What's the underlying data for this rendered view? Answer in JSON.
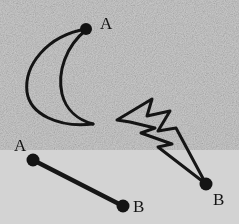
{
  "figure": {
    "background_color": "#d3d3d3",
    "ink_color": "#161616",
    "width": 239,
    "height": 224,
    "shapes": [
      {
        "name": "crescent-moon",
        "type": "crescent",
        "stroke_width": 3,
        "outer_arc": "M 86 29 C 46 36, 24 66, 27 92 C 30 114, 58 128, 93 124",
        "inner_arc": "M 86 30 C 66 46, 57 72, 62 94 C 66 110, 78 120, 93 124",
        "endpoints": [
          {
            "label": "A",
            "dot": true,
            "x": 86,
            "y": 29
          },
          {
            "label": "",
            "dot": false,
            "x": 93,
            "y": 124
          }
        ]
      },
      {
        "name": "lightning-bolt",
        "type": "polyline",
        "stroke_width": 3,
        "path": "M 117 120 L 152 99 L 147 116 L 170 111 L 158 131 L 176 128 L 206 184 L 158 147 L 172 144 L 141 133 L 155 128 L 130 122 Z",
        "endpoints": [
          {
            "label": "B",
            "dot": true,
            "x": 206,
            "y": 184
          }
        ]
      },
      {
        "name": "line-segment",
        "type": "line",
        "stroke_width": 4,
        "path": "M 33 160 L 123 206",
        "endpoints": [
          {
            "label": "A",
            "dot": true,
            "x": 33,
            "y": 160
          },
          {
            "label": "B",
            "dot": true,
            "x": 123,
            "y": 206
          }
        ]
      }
    ],
    "labels": [
      {
        "name": "label-a-crescent",
        "text": "A",
        "x": 100,
        "y": 15
      },
      {
        "name": "label-a-segment",
        "text": "A",
        "x": 14,
        "y": 137
      },
      {
        "name": "label-b-segment",
        "text": "B",
        "x": 133,
        "y": 198
      },
      {
        "name": "label-b-bolt",
        "text": "B",
        "x": 213,
        "y": 191
      }
    ]
  }
}
